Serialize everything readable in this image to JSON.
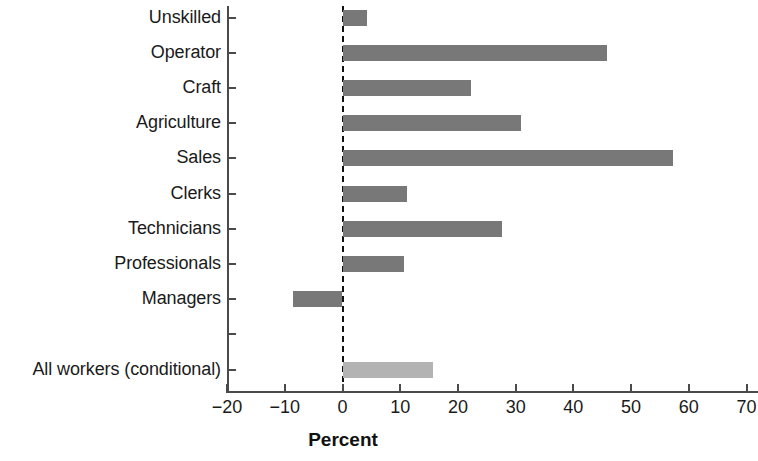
{
  "chart_data": {
    "type": "bar",
    "orientation": "horizontal",
    "title": "",
    "xlabel": "Percent",
    "ylabel": "",
    "xlim": [
      -20,
      70
    ],
    "xticks": [
      -20,
      -10,
      0,
      10,
      20,
      30,
      40,
      50,
      60,
      70
    ],
    "xticklabels": [
      "−20",
      "−10",
      "0",
      "10",
      "20",
      "30",
      "40",
      "50",
      "60",
      "70"
    ],
    "grid": false,
    "legend": null,
    "zero_reference_line": {
      "value": 0,
      "style": "dashed",
      "color": "#111111"
    },
    "categories": [
      "Unskilled",
      "Operator",
      "Craft",
      "Agriculture",
      "Sales",
      "Clerks",
      "Technicians",
      "Professionals",
      "Managers",
      "",
      "All workers (conditional)"
    ],
    "values": [
      4.3,
      45.9,
      22.3,
      31.0,
      57.2,
      11.1,
      27.6,
      10.7,
      -8.5,
      null,
      15.6
    ],
    "bar_colors": [
      "#787878",
      "#787878",
      "#787878",
      "#787878",
      "#787878",
      "#787878",
      "#787878",
      "#787878",
      "#787878",
      null,
      "#b3b3b3"
    ],
    "series": [
      {
        "name": "Percent",
        "points": [
          {
            "category": "Unskilled",
            "value": 4.3,
            "color": "#787878"
          },
          {
            "category": "Operator",
            "value": 45.9,
            "color": "#787878"
          },
          {
            "category": "Craft",
            "value": 22.3,
            "color": "#787878"
          },
          {
            "category": "Agriculture",
            "value": 31.0,
            "color": "#787878"
          },
          {
            "category": "Sales",
            "value": 57.2,
            "color": "#787878"
          },
          {
            "category": "Clerks",
            "value": 11.1,
            "color": "#787878"
          },
          {
            "category": "Technicians",
            "value": 27.6,
            "color": "#787878"
          },
          {
            "category": "Professionals",
            "value": 10.7,
            "color": "#787878"
          },
          {
            "category": "Managers",
            "value": -8.5,
            "color": "#787878"
          },
          {
            "category": "",
            "value": null,
            "color": null
          },
          {
            "category": "All workers (conditional)",
            "value": 15.6,
            "color": "#b3b3b3"
          }
        ]
      }
    ],
    "colors": {
      "bar_dark": "#787878",
      "bar_light": "#b3b3b3",
      "axis": "#4a4a4a",
      "text": "#1a1a1a",
      "background": "#ffffff"
    }
  },
  "axis_title": {
    "x": "Percent"
  }
}
